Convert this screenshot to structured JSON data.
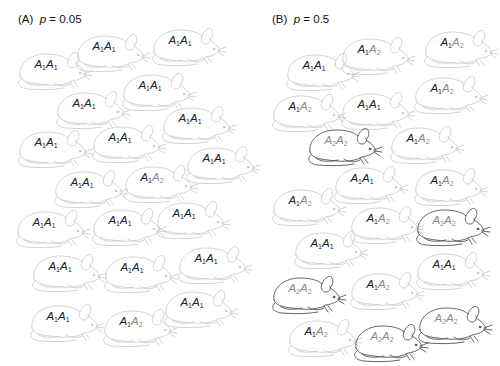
{
  "panels": [
    {
      "id": "A",
      "title_prefix": "(A)",
      "param": "p",
      "title_suffix": "= 0.05",
      "title_x": 18,
      "title_y": 13,
      "mice": [
        {
          "x": 14,
          "y": 46,
          "genotype": "A1A1"
        },
        {
          "x": 72,
          "y": 28,
          "genotype": "A1A1"
        },
        {
          "x": 148,
          "y": 22,
          "genotype": "A1A1"
        },
        {
          "x": 118,
          "y": 67,
          "genotype": "A1A1"
        },
        {
          "x": 52,
          "y": 85,
          "genotype": "A1A1"
        },
        {
          "x": 14,
          "y": 124,
          "genotype": "A1A1"
        },
        {
          "x": 88,
          "y": 119,
          "genotype": "A1A1"
        },
        {
          "x": 158,
          "y": 100,
          "genotype": "A1A1"
        },
        {
          "x": 182,
          "y": 140,
          "genotype": "A1A1"
        },
        {
          "x": 50,
          "y": 164,
          "genotype": "A1A1"
        },
        {
          "x": 120,
          "y": 159,
          "genotype": "A1A2"
        },
        {
          "x": 12,
          "y": 204,
          "genotype": "A1A1"
        },
        {
          "x": 88,
          "y": 202,
          "genotype": "A1A1"
        },
        {
          "x": 152,
          "y": 195,
          "genotype": "A1A1"
        },
        {
          "x": 28,
          "y": 248,
          "genotype": "A1A1"
        },
        {
          "x": 100,
          "y": 249,
          "genotype": "A1A1"
        },
        {
          "x": 174,
          "y": 240,
          "genotype": "A1A1"
        },
        {
          "x": 26,
          "y": 298,
          "genotype": "A1A1"
        },
        {
          "x": 99,
          "y": 303,
          "genotype": "A1A2"
        },
        {
          "x": 160,
          "y": 284,
          "genotype": "A1A1"
        }
      ]
    },
    {
      "id": "B",
      "title_prefix": "(B)",
      "param": "p",
      "title_suffix": "= 0.5",
      "title_x": 272,
      "title_y": 13,
      "mice": [
        {
          "x": 282,
          "y": 47,
          "genotype": "A1A1"
        },
        {
          "x": 337,
          "y": 31,
          "genotype": "A1A2"
        },
        {
          "x": 420,
          "y": 24,
          "genotype": "A1A2"
        },
        {
          "x": 410,
          "y": 70,
          "genotype": "A1A2"
        },
        {
          "x": 268,
          "y": 88,
          "genotype": "A1A2"
        },
        {
          "x": 337,
          "y": 86,
          "genotype": "A1A1"
        },
        {
          "x": 304,
          "y": 122,
          "genotype": "A2A2"
        },
        {
          "x": 386,
          "y": 120,
          "genotype": "A1A2"
        },
        {
          "x": 330,
          "y": 160,
          "genotype": "A1A1"
        },
        {
          "x": 410,
          "y": 162,
          "genotype": "A1A2"
        },
        {
          "x": 268,
          "y": 182,
          "genotype": "A1A2"
        },
        {
          "x": 346,
          "y": 200,
          "genotype": "A1A2"
        },
        {
          "x": 412,
          "y": 202,
          "genotype": "A2A2"
        },
        {
          "x": 290,
          "y": 225,
          "genotype": "A1A1"
        },
        {
          "x": 412,
          "y": 246,
          "genotype": "A1A1"
        },
        {
          "x": 268,
          "y": 270,
          "genotype": "A2A2"
        },
        {
          "x": 346,
          "y": 266,
          "genotype": "A1A2"
        },
        {
          "x": 414,
          "y": 300,
          "genotype": "A2A2"
        },
        {
          "x": 284,
          "y": 313,
          "genotype": "A1A2"
        },
        {
          "x": 350,
          "y": 318,
          "genotype": "A2A2"
        }
      ]
    }
  ],
  "colors": {
    "allele1_text": "#222222",
    "allele2_text": "#8a8a8a",
    "outline_light": "#c8c8c8",
    "outline_dark": "#555555"
  }
}
